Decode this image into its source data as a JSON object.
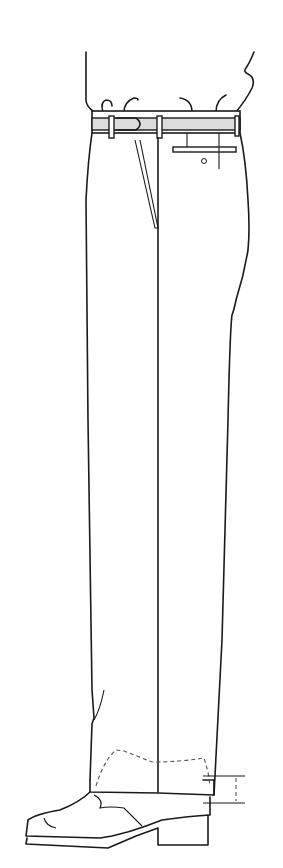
{
  "figure": {
    "parts": [
      "waistband",
      "belt-loops",
      "side-pocket",
      "back-pocket",
      "button",
      "front-crease",
      "hem",
      "shoe",
      "hem-break-measure"
    ]
  },
  "colors": {
    "line": "#1a1a1a",
    "waistband_fill": "#dcdcdc",
    "dash": "#555555",
    "background": "#ffffff"
  }
}
